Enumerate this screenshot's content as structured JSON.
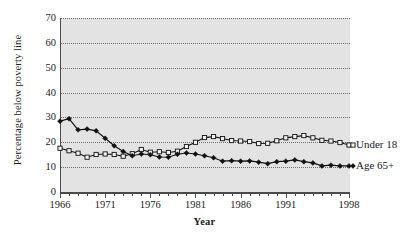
{
  "chart_data": {
    "type": "line",
    "title": "",
    "xlabel": "Year",
    "ylabel": "Percentage below poverty line",
    "xlim": [
      1966,
      1998
    ],
    "ylim": [
      0,
      70
    ],
    "grid": true,
    "legend_position": "right-inline",
    "y_ticks": [
      0,
      10,
      20,
      30,
      40,
      50,
      60,
      70
    ],
    "y_tick_labels": [
      "0",
      "10",
      "20",
      "30",
      "40",
      "50",
      "60",
      "70"
    ],
    "x_ticks": [
      1966,
      1967,
      1968,
      1969,
      1970,
      1971,
      1972,
      1973,
      1974,
      1975,
      1976,
      1977,
      1978,
      1979,
      1980,
      1981,
      1982,
      1983,
      1984,
      1985,
      1986,
      1987,
      1988,
      1989,
      1990,
      1991,
      1992,
      1993,
      1994,
      1995,
      1996,
      1997,
      1998
    ],
    "x_tick_labels": [
      "1966",
      "1971",
      "1976",
      "1981",
      "1986",
      "1991",
      "1998"
    ],
    "x_labeled_ticks": [
      1966,
      1971,
      1976,
      1981,
      1986,
      1991,
      1998
    ],
    "x": [
      1966,
      1967,
      1968,
      1969,
      1970,
      1971,
      1972,
      1973,
      1974,
      1975,
      1976,
      1977,
      1978,
      1979,
      1980,
      1981,
      1982,
      1983,
      1984,
      1985,
      1986,
      1987,
      1988,
      1989,
      1990,
      1991,
      1992,
      1993,
      1994,
      1995,
      1996,
      1997,
      1998
    ],
    "series": [
      {
        "name": "Under 18",
        "marker": "open-square",
        "values": [
          17.6,
          16.6,
          15.6,
          14.0,
          15.1,
          15.3,
          15.1,
          14.4,
          15.4,
          17.1,
          16.0,
          16.2,
          15.9,
          16.4,
          18.3,
          20.0,
          21.9,
          22.3,
          21.5,
          20.7,
          20.5,
          20.3,
          19.5,
          19.6,
          20.6,
          21.8,
          22.3,
          22.7,
          21.8,
          20.8,
          20.5,
          19.9,
          18.9
        ]
      },
      {
        "name": "Age 65+",
        "marker": "filled-diamond",
        "values": [
          28.5,
          29.5,
          25.0,
          25.3,
          24.6,
          21.6,
          18.6,
          16.3,
          14.6,
          15.3,
          15.0,
          14.1,
          14.0,
          15.2,
          15.7,
          15.3,
          14.6,
          13.8,
          12.4,
          12.6,
          12.4,
          12.5,
          12.0,
          11.4,
          12.2,
          12.4,
          12.9,
          12.2,
          11.7,
          10.5,
          10.8,
          10.5,
          10.5
        ]
      }
    ]
  },
  "legend": {
    "under18": "Under 18",
    "age65": "Age 65+"
  },
  "colors": {
    "plot_background": "#e3e3e3",
    "axis": "#4a4a4a",
    "gridline": "#6e6e6e",
    "line": "#111111"
  }
}
